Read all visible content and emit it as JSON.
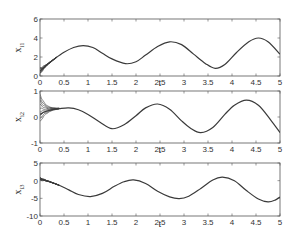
{
  "chart_data": [
    {
      "type": "line",
      "title": "",
      "xlabel": "t",
      "ylabel": "x_i1",
      "ylabel_main": "x",
      "ylabel_sub": "i1",
      "xlim": [
        0,
        5
      ],
      "ylim": [
        0,
        6
      ],
      "xticks": [
        0,
        0.5,
        1,
        1.5,
        2,
        2.5,
        3,
        3.5,
        4,
        4.5,
        5
      ],
      "xtick_labels": [
        "0",
        "0.5",
        "1",
        "1.5",
        "2",
        "2.5",
        "3",
        "3.5",
        "4",
        "4.5",
        "5"
      ],
      "yticks": [
        0,
        2,
        4,
        6
      ],
      "ytick_labels": [
        "0",
        "2",
        "4",
        "6"
      ],
      "grid": false,
      "legend": null,
      "transient_bundle": {
        "t_end": 0.35,
        "spread_at_0": [
          0.2,
          0.9
        ]
      },
      "series": [
        {
          "name": "x_i1",
          "x": [
            0,
            0.15,
            0.3,
            0.5,
            0.7,
            0.9,
            1.1,
            1.3,
            1.5,
            1.78,
            2.0,
            2.2,
            2.45,
            2.7,
            2.95,
            3.2,
            3.45,
            3.65,
            3.85,
            4.1,
            4.35,
            4.55,
            4.75,
            5.0
          ],
          "values": [
            0.5,
            1.2,
            1.8,
            2.5,
            3.0,
            3.2,
            3.0,
            2.4,
            1.8,
            1.3,
            1.5,
            2.2,
            3.1,
            3.6,
            3.3,
            2.3,
            1.3,
            0.8,
            1.2,
            2.5,
            3.6,
            4.0,
            3.6,
            2.3
          ]
        }
      ]
    },
    {
      "type": "line",
      "title": "",
      "xlabel": "t",
      "ylabel": "x_i2",
      "ylabel_main": "x",
      "ylabel_sub": "i2",
      "xlim": [
        0,
        5
      ],
      "ylim": [
        -1,
        1
      ],
      "xticks": [
        0,
        0.5,
        1,
        1.5,
        2,
        2.5,
        3,
        3.5,
        4,
        4.5,
        5
      ],
      "xtick_labels": [
        "0",
        "0.5",
        "1",
        "1.5",
        "2",
        "2.5",
        "3",
        "3.5",
        "4",
        "4.5",
        "5"
      ],
      "yticks": [
        -1,
        0,
        1
      ],
      "ytick_labels": [
        "-1",
        "0",
        "1"
      ],
      "grid": false,
      "legend": null,
      "transient_bundle": {
        "t_end": 0.4,
        "spread_at_0": [
          -0.2,
          0.9
        ]
      },
      "series": [
        {
          "name": "x_i2",
          "x": [
            0,
            0.1,
            0.25,
            0.4,
            0.6,
            0.8,
            1.0,
            1.25,
            1.5,
            1.75,
            2.0,
            2.2,
            2.45,
            2.7,
            2.95,
            3.15,
            3.35,
            3.6,
            3.85,
            4.05,
            4.3,
            4.55,
            4.8,
            5.0
          ],
          "values": [
            0.1,
            0.2,
            0.28,
            0.32,
            0.35,
            0.28,
            0.1,
            -0.2,
            -0.45,
            -0.3,
            0.05,
            0.35,
            0.5,
            0.3,
            -0.15,
            -0.45,
            -0.6,
            -0.4,
            0.1,
            0.45,
            0.65,
            0.45,
            -0.1,
            -0.6
          ]
        }
      ]
    },
    {
      "type": "line",
      "title": "",
      "xlabel": "t",
      "ylabel": "x_i3",
      "ylabel_main": "x",
      "ylabel_sub": "i3",
      "xlim": [
        0,
        5
      ],
      "ylim": [
        -10,
        5
      ],
      "xticks": [
        0,
        0.5,
        1,
        1.5,
        2,
        2.5,
        3,
        3.5,
        4,
        4.5,
        5
      ],
      "xtick_labels": [
        "0",
        "0.5",
        "1",
        "1.5",
        "2",
        "2.5",
        "3",
        "3.5",
        "4",
        "4.5",
        "5"
      ],
      "yticks": [
        -10,
        -5,
        0,
        5
      ],
      "ytick_labels": [
        "-10",
        "-5",
        "0",
        "5"
      ],
      "grid": false,
      "legend": null,
      "transient_bundle": {
        "t_end": 0.4,
        "spread_at_0": [
          0.2,
          0.9
        ]
      },
      "series": [
        {
          "name": "x_i3",
          "x": [
            0,
            0.2,
            0.4,
            0.6,
            0.8,
            1.05,
            1.3,
            1.55,
            1.75,
            1.95,
            2.2,
            2.45,
            2.7,
            2.9,
            3.1,
            3.35,
            3.6,
            3.8,
            4.05,
            4.3,
            4.55,
            4.75,
            4.9,
            5.0
          ],
          "values": [
            0.5,
            -0.3,
            -1.3,
            -2.6,
            -3.9,
            -4.5,
            -3.6,
            -1.6,
            -0.3,
            0.2,
            -0.8,
            -3.0,
            -4.6,
            -5.1,
            -4.4,
            -2.2,
            0.2,
            1.0,
            0.0,
            -2.8,
            -5.2,
            -6.0,
            -5.5,
            -4.6
          ]
        }
      ]
    }
  ],
  "panels": [
    {
      "ylabel_main": "x",
      "ylabel_sub": "i1",
      "xlabel": "t"
    },
    {
      "ylabel_main": "x",
      "ylabel_sub": "i2",
      "xlabel": "t"
    },
    {
      "ylabel_main": "x",
      "ylabel_sub": "i3",
      "xlabel": "t"
    }
  ],
  "colors": {
    "line": "#3a3a3a",
    "axes": "#555555",
    "background": "#ffffff"
  }
}
